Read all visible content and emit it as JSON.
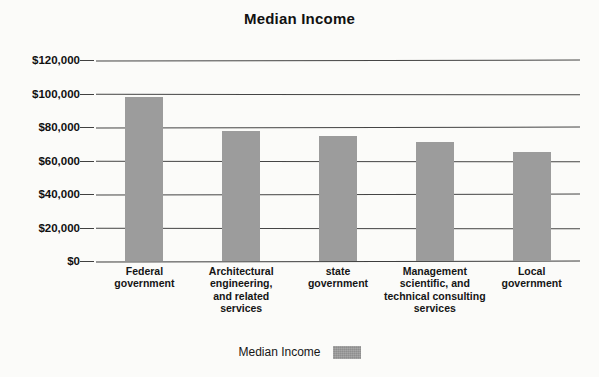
{
  "chart_data": {
    "type": "bar",
    "title": "Median Income",
    "xlabel": "",
    "ylabel": "",
    "categories": [
      "Federal government",
      "Architectural engineering, and related services",
      "state government",
      "Management scientific, and technical consulting services",
      "Local government"
    ],
    "values": [
      98000,
      77500,
      74500,
      71000,
      65000
    ],
    "series": [
      {
        "name": "Median Income",
        "values": [
          98000,
          77500,
          74500,
          71000,
          65000
        ]
      }
    ],
    "ylim": [
      0,
      120000
    ],
    "ytick_values": [
      120000,
      100000,
      80000,
      60000,
      40000,
      20000,
      0
    ],
    "ytick_labels": [
      "$120,000",
      "$100,000",
      "$80,000",
      "$60,000",
      "$40,000",
      "$20,000",
      "$0"
    ],
    "grid": true,
    "legend_position": "bottom",
    "legend_entries": [
      "Median Income"
    ],
    "bar_color": "#9c9c9c",
    "background_color": "#fbfbf9",
    "axis_color": "#2b2b2b"
  },
  "category_lines": [
    [
      "Federal",
      "government"
    ],
    [
      "Architectural",
      "engineering,",
      "and related",
      "services"
    ],
    [
      "state",
      "government"
    ],
    [
      "Management",
      "scientific, and",
      "technical consulting",
      "services"
    ],
    [
      "Local",
      "government"
    ]
  ],
  "legend": {
    "label": "Median Income"
  }
}
